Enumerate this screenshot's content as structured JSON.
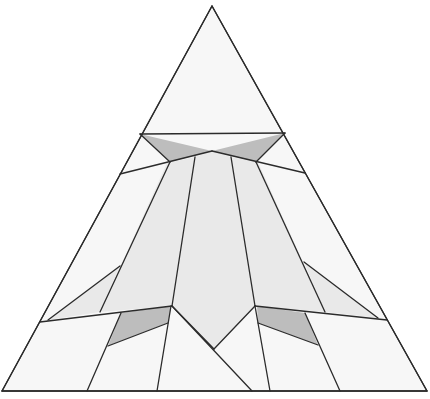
{
  "diagram": {
    "type": "triangle-dissection",
    "canvas": {
      "width": 430,
      "height": 399
    },
    "colors": {
      "background": "#ffffff",
      "white_fill": "#f7f7f7",
      "light_fill": "#e9e9e9",
      "dark_fill": "#bdbdbd",
      "stroke": "#2b2b2b"
    },
    "outer_triangle": [
      [
        212,
        6
      ],
      [
        427,
        391
      ],
      [
        2,
        391
      ]
    ],
    "regions": [
      {
        "name": "top-cap",
        "fill": "white_fill",
        "points": [
          [
            212,
            6
          ],
          [
            285,
            133
          ],
          [
            212,
            151
          ],
          [
            140,
            134
          ]
        ]
      },
      {
        "name": "bowtie-left",
        "fill": "dark_fill",
        "points": [
          [
            140,
            134
          ],
          [
            212,
            151
          ],
          [
            170,
            162
          ]
        ]
      },
      {
        "name": "bowtie-right",
        "fill": "dark_fill",
        "points": [
          [
            285,
            133
          ],
          [
            256,
            162
          ],
          [
            212,
            151
          ]
        ]
      },
      {
        "name": "upper-left-wedge",
        "fill": "white_fill",
        "points": [
          [
            140,
            134
          ],
          [
            170,
            162
          ],
          [
            120,
            174
          ]
        ]
      },
      {
        "name": "upper-right-wedge",
        "fill": "white_fill",
        "points": [
          [
            285,
            133
          ],
          [
            305,
            173
          ],
          [
            256,
            162
          ]
        ]
      },
      {
        "name": "left-outer-band",
        "fill": "white_fill",
        "points": [
          [
            120,
            174
          ],
          [
            167,
            163
          ],
          [
            100,
            312
          ],
          [
            40,
            322
          ]
        ]
      },
      {
        "name": "right-outer-band",
        "fill": "white_fill",
        "points": [
          [
            305,
            173
          ],
          [
            387,
            320
          ],
          [
            325,
            312
          ],
          [
            258,
            162
          ]
        ]
      },
      {
        "name": "fan-left",
        "fill": "light_fill",
        "points": [
          [
            167,
            163
          ],
          [
            195,
            157
          ],
          [
            172,
            306
          ],
          [
            100,
            312
          ]
        ]
      },
      {
        "name": "fan-center",
        "fill": "light_fill",
        "points": [
          [
            195,
            157
          ],
          [
            212,
            151
          ],
          [
            231,
            157
          ],
          [
            255,
            306
          ],
          [
            214,
            349
          ],
          [
            172,
            306
          ]
        ]
      },
      {
        "name": "fan-right",
        "fill": "light_fill",
        "points": [
          [
            231,
            157
          ],
          [
            258,
            162
          ],
          [
            325,
            312
          ],
          [
            255,
            306
          ]
        ]
      },
      {
        "name": "small-left-triangle",
        "fill": "light_fill",
        "points": [
          [
            120,
            266
          ],
          [
            100,
            312
          ],
          [
            48,
            320
          ]
        ]
      },
      {
        "name": "small-right-triangle",
        "fill": "light_fill",
        "points": [
          [
            304,
            262
          ],
          [
            378,
            318
          ],
          [
            325,
            312
          ]
        ]
      },
      {
        "name": "lower-dark-left",
        "fill": "dark_fill",
        "points": [
          [
            121,
            313
          ],
          [
            171,
            306
          ],
          [
            168,
            323
          ],
          [
            108,
            346
          ]
        ]
      },
      {
        "name": "lower-dark-right",
        "fill": "dark_fill",
        "points": [
          [
            257,
            306
          ],
          [
            305,
            313
          ],
          [
            318,
            345
          ],
          [
            258,
            323
          ]
        ]
      },
      {
        "name": "bottom-left-outer",
        "fill": "white_fill",
        "points": [
          [
            40,
            322
          ],
          [
            121,
            313
          ],
          [
            87,
            391
          ],
          [
            2,
            391
          ]
        ]
      },
      {
        "name": "bottom-left-mid",
        "fill": "white_fill",
        "points": [
          [
            108,
            346
          ],
          [
            168,
            323
          ],
          [
            157,
            391
          ],
          [
            87,
            391
          ]
        ]
      },
      {
        "name": "bottom-center-left",
        "fill": "white_fill",
        "points": [
          [
            172,
            306
          ],
          [
            252,
            391
          ],
          [
            157,
            391
          ]
        ]
      },
      {
        "name": "bottom-center-right",
        "fill": "white_fill",
        "points": [
          [
            255,
            306
          ],
          [
            270,
            391
          ],
          [
            252,
            391
          ],
          [
            214,
            349
          ]
        ]
      },
      {
        "name": "bottom-right-mid",
        "fill": "white_fill",
        "points": [
          [
            258,
            323
          ],
          [
            318,
            345
          ],
          [
            340,
            391
          ],
          [
            270,
            391
          ]
        ]
      },
      {
        "name": "bottom-right-outer",
        "fill": "white_fill",
        "points": [
          [
            305,
            313
          ],
          [
            387,
            320
          ],
          [
            427,
            391
          ],
          [
            340,
            391
          ]
        ]
      }
    ],
    "edges": [
      [
        [
          212,
          6
        ],
        [
          427,
          391
        ]
      ],
      [
        [
          212,
          6
        ],
        [
          2,
          391
        ]
      ],
      [
        [
          2,
          391
        ],
        [
          427,
          391
        ]
      ],
      [
        [
          140,
          134
        ],
        [
          285,
          133
        ]
      ],
      [
        [
          140,
          134
        ],
        [
          170,
          162
        ]
      ],
      [
        [
          285,
          133
        ],
        [
          256,
          162
        ]
      ],
      [
        [
          120,
          174
        ],
        [
          212,
          151
        ]
      ],
      [
        [
          212,
          151
        ],
        [
          305,
          173
        ]
      ],
      [
        [
          170,
          162
        ],
        [
          100,
          312
        ]
      ],
      [
        [
          195,
          157
        ],
        [
          172,
          306
        ]
      ],
      [
        [
          231,
          157
        ],
        [
          255,
          306
        ]
      ],
      [
        [
          256,
          162
        ],
        [
          325,
          312
        ]
      ],
      [
        [
          40,
          322
        ],
        [
          172,
          306
        ]
      ],
      [
        [
          255,
          306
        ],
        [
          387,
          320
        ]
      ],
      [
        [
          120,
          266
        ],
        [
          48,
          320
        ]
      ],
      [
        [
          304,
          262
        ],
        [
          378,
          318
        ]
      ],
      [
        [
          172,
          306
        ],
        [
          214,
          349
        ]
      ],
      [
        [
          214,
          349
        ],
        [
          255,
          306
        ]
      ],
      [
        [
          172,
          306
        ],
        [
          252,
          391
        ]
      ],
      [
        [
          121,
          313
        ],
        [
          87,
          391
        ]
      ],
      [
        [
          108,
          346
        ],
        [
          168,
          323
        ]
      ],
      [
        [
          171,
          306
        ],
        [
          157,
          391
        ]
      ],
      [
        [
          255,
          306
        ],
        [
          270,
          391
        ]
      ],
      [
        [
          258,
          323
        ],
        [
          318,
          345
        ]
      ],
      [
        [
          305,
          313
        ],
        [
          340,
          391
        ]
      ]
    ]
  }
}
